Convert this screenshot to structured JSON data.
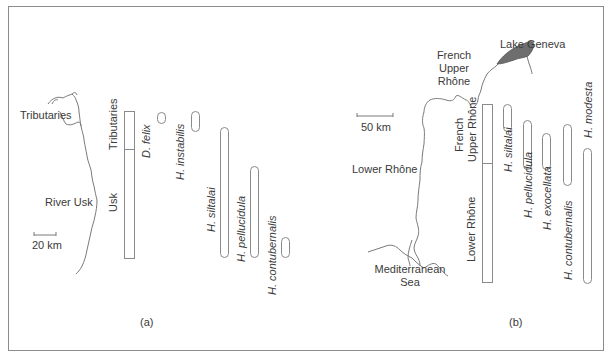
{
  "panels": {
    "a": {
      "label": "(a)",
      "map": {
        "tributaries_label": "Tributaries",
        "river_label": "River Usk",
        "scale_label": "20 km"
      },
      "reach_bar": {
        "segments": [
          "Tributaries",
          "Usk"
        ]
      },
      "species": [
        {
          "name": "D. felix"
        },
        {
          "name": "H. instabilis"
        },
        {
          "name": "H. siltalai"
        },
        {
          "name": "H. pellucidula"
        },
        {
          "name": "H. contubernalis"
        }
      ]
    },
    "b": {
      "label": "(b)",
      "map": {
        "lake_label": "Lake Geneva",
        "upper_label_1": "French",
        "upper_label_2": "Upper",
        "upper_label_3": "Rhône",
        "lower_label": "Lower Rhône",
        "sea_label_1": "Mediterranean",
        "sea_label_2": "Sea",
        "scale_label": "50 km"
      },
      "reach_bar": {
        "segments": [
          "French Upper Rhône",
          "Lower Rhône"
        ]
      },
      "species": [
        {
          "name": "H. siltalai"
        },
        {
          "name": "H. pellucidula"
        },
        {
          "name": "H. exocellata"
        },
        {
          "name": "H. contubernalis"
        },
        {
          "name": "H. modesta"
        }
      ]
    }
  },
  "colors": {
    "line": "#8a8a8a",
    "lake_fill": "#6e6e6e",
    "text": "#3a3a3a"
  }
}
